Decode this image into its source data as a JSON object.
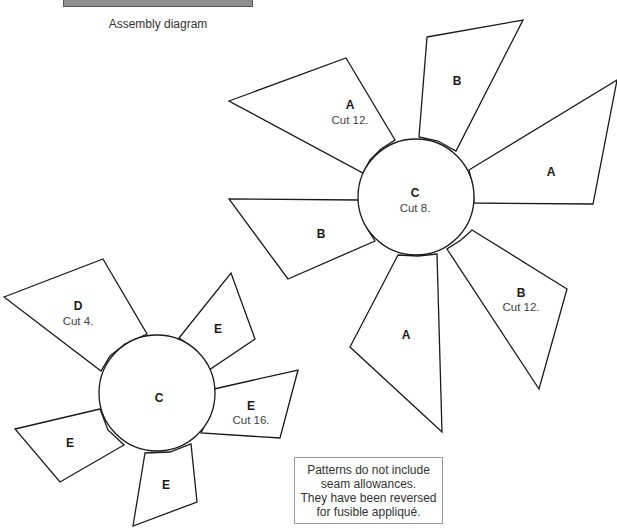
{
  "header": {
    "caption": "Assembly diagram",
    "bar_color": "#8e8e8e"
  },
  "large_flower": {
    "center": {
      "label": "C",
      "cut": "Cut 8."
    },
    "petals": [
      {
        "id": "upper-left-a",
        "label": "A",
        "cut": "Cut 12."
      },
      {
        "id": "top-b",
        "label": "B",
        "cut": ""
      },
      {
        "id": "right-a",
        "label": "A",
        "cut": ""
      },
      {
        "id": "lower-right-b",
        "label": "B",
        "cut": "Cut 12."
      },
      {
        "id": "bottom-a",
        "label": "A",
        "cut": ""
      },
      {
        "id": "left-b",
        "label": "B",
        "cut": ""
      }
    ]
  },
  "small_flower": {
    "center": {
      "label": "C",
      "cut": ""
    },
    "petals": [
      {
        "id": "upper-left-d",
        "label": "D",
        "cut": "Cut 4."
      },
      {
        "id": "upper-right-e",
        "label": "E",
        "cut": ""
      },
      {
        "id": "right-e",
        "label": "E",
        "cut": "Cut 16."
      },
      {
        "id": "bottom-e",
        "label": "E",
        "cut": ""
      },
      {
        "id": "left-e",
        "label": "E",
        "cut": ""
      }
    ]
  },
  "note": {
    "lines": [
      "Patterns do not include",
      "seam allowances.",
      "They have been reversed",
      "for fusible appliqué."
    ]
  }
}
